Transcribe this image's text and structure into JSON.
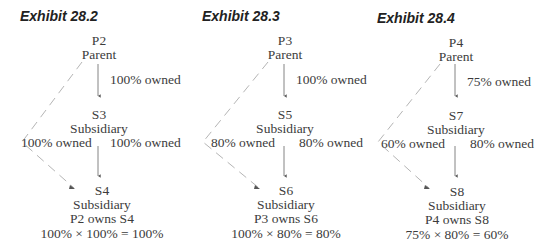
{
  "exhibits": [
    {
      "title": "Exhibit 28.2",
      "parent": {
        "code": "P2",
        "label": "Parent"
      },
      "top_ownership": "100% owned",
      "middle": {
        "code": "S3",
        "label": "Subsidiary"
      },
      "direct_ownership_left": "100% owned",
      "middle_ownership": "100% owned",
      "bottom": {
        "code": "S4",
        "label": "Subsidiary",
        "owns": "P2 owns S4",
        "formula": "100% × 100% = 100%"
      }
    },
    {
      "title": "Exhibit 28.3",
      "parent": {
        "code": "P3",
        "label": "Parent"
      },
      "top_ownership": "100% owned",
      "middle": {
        "code": "S5",
        "label": "Subsidiary"
      },
      "direct_ownership_left": "80% owned",
      "middle_ownership": "80% owned",
      "bottom": {
        "code": "S6",
        "label": "Subsidiary",
        "owns": "P3 owns S6",
        "formula": "100% × 80% = 80%"
      }
    },
    {
      "title": "Exhibit 28.4",
      "parent": {
        "code": "P4",
        "label": "Parent"
      },
      "top_ownership": "75% owned",
      "middle": {
        "code": "S7",
        "label": "Subsidiary"
      },
      "direct_ownership_left": "60% owned",
      "middle_ownership": "80% owned",
      "bottom": {
        "code": "S8",
        "label": "Subsidiary",
        "owns": "P4 owns S8",
        "formula": "75% × 80% = 60%"
      }
    }
  ],
  "colors": {
    "solid_arrow": "#555555",
    "dashed_arrow": "#b5b5b5",
    "text": "#3c3c3c"
  }
}
